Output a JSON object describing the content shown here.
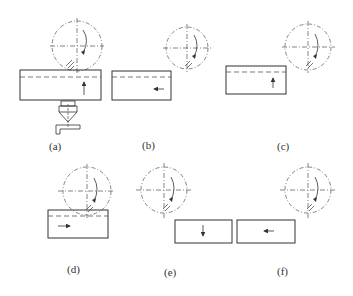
{
  "caption_cutoff": "",
  "panels": [
    {
      "id": "a",
      "label": "(a)",
      "motion": "up",
      "has_tool": true
    },
    {
      "id": "b",
      "label": "(b)",
      "motion": "left"
    },
    {
      "id": "c",
      "label": "(c)",
      "motion": "up"
    },
    {
      "id": "d",
      "label": "(d)",
      "motion": "right"
    },
    {
      "id": "e",
      "label": "(e)",
      "motion": "down"
    },
    {
      "id": "f",
      "label": "(f)",
      "motion": "left"
    }
  ],
  "colors": {
    "line": "#333333",
    "dash": "#777777"
  }
}
